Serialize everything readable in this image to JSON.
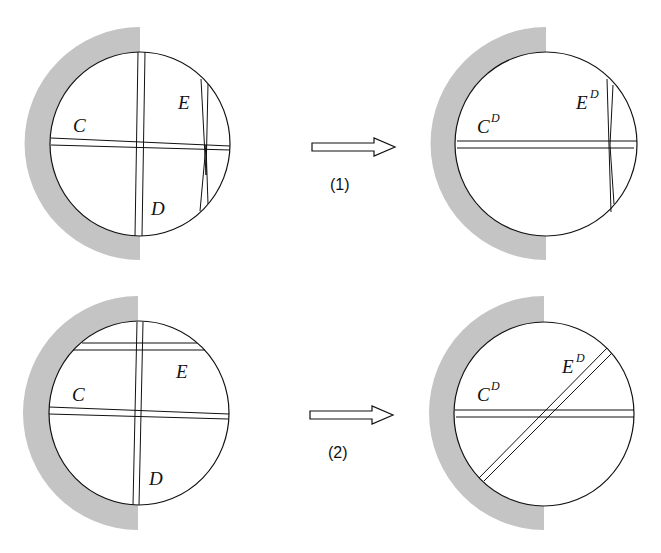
{
  "colors": {
    "background": "#ffffff",
    "wall": "#c4c4c4",
    "stroke": "#111111"
  },
  "panels": [
    {
      "id": "top-left",
      "state": "before",
      "labels": {
        "c": "C",
        "d": "D",
        "e": "E"
      }
    },
    {
      "id": "top-right",
      "state": "after",
      "labels": {
        "c": "C",
        "c_sup": "D",
        "e": "E",
        "e_sup": "D"
      }
    },
    {
      "id": "bottom-left",
      "state": "before",
      "labels": {
        "c": "C",
        "d": "D",
        "e": "E"
      }
    },
    {
      "id": "bottom-right",
      "state": "after",
      "labels": {
        "c": "C",
        "c_sup": "D",
        "e": "E",
        "e_sup": "D"
      }
    }
  ],
  "transitions": [
    {
      "label": "(1)",
      "from": "top-left",
      "to": "top-right"
    },
    {
      "label": "(2)",
      "from": "bottom-left",
      "to": "bottom-right"
    }
  ]
}
